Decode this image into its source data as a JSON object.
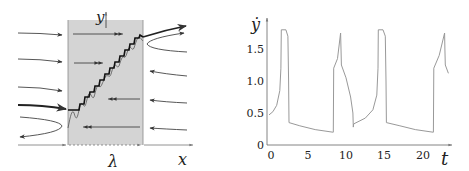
{
  "left_panel": {
    "x_label": "x",
    "y_label": "y",
    "width_label": "λ",
    "band_color": "#d4d4d4",
    "line_color": "#333333"
  },
  "right_panel": {
    "y_label": "ẏ",
    "x_label": "t",
    "line_color": "#999999"
  },
  "chart_data": {
    "type": "line",
    "title": "",
    "xlabel": "t",
    "ylabel": "ẏ",
    "xlim": [
      0,
      24
    ],
    "ylim": [
      0,
      1.9
    ],
    "xticks": [
      0,
      5,
      10,
      15,
      20
    ],
    "xtick_labels": [
      "0",
      "5",
      "10",
      "15",
      "20"
    ],
    "yticks": [
      0,
      0.5,
      1.0,
      1.5
    ],
    "ytick_labels": [
      "0",
      "0.5",
      "1.0",
      "1.5"
    ],
    "grid": false,
    "series": [
      {
        "name": "ẏ(t)",
        "x": [
          0,
          0.5,
          1.0,
          1.4,
          1.55,
          1.6,
          2.2,
          2.45,
          2.55,
          2.6,
          4,
          6,
          8.3,
          8.35,
          8.4,
          8.9,
          9.3,
          9.35,
          9.4,
          10.0,
          10.6,
          10.9,
          10.95,
          11.0,
          12.5,
          13.5,
          14.0,
          14.15,
          14.2,
          14.8,
          15.1,
          15.2,
          15.25,
          17,
          19,
          21.3,
          21.35,
          21.4,
          22.1,
          22.8,
          22.85,
          22.9,
          23.3
        ],
        "y": [
          0.47,
          0.52,
          0.62,
          0.85,
          1.2,
          1.8,
          1.8,
          1.7,
          1.0,
          0.35,
          0.3,
          0.24,
          0.2,
          0.2,
          1.2,
          1.35,
          1.75,
          1.5,
          1.25,
          1.05,
          0.75,
          0.5,
          0.28,
          0.33,
          0.42,
          0.55,
          0.78,
          1.2,
          1.8,
          1.8,
          1.7,
          1.0,
          0.35,
          0.3,
          0.24,
          0.2,
          0.2,
          1.2,
          1.4,
          1.75,
          1.5,
          1.25,
          1.12
        ]
      }
    ]
  }
}
